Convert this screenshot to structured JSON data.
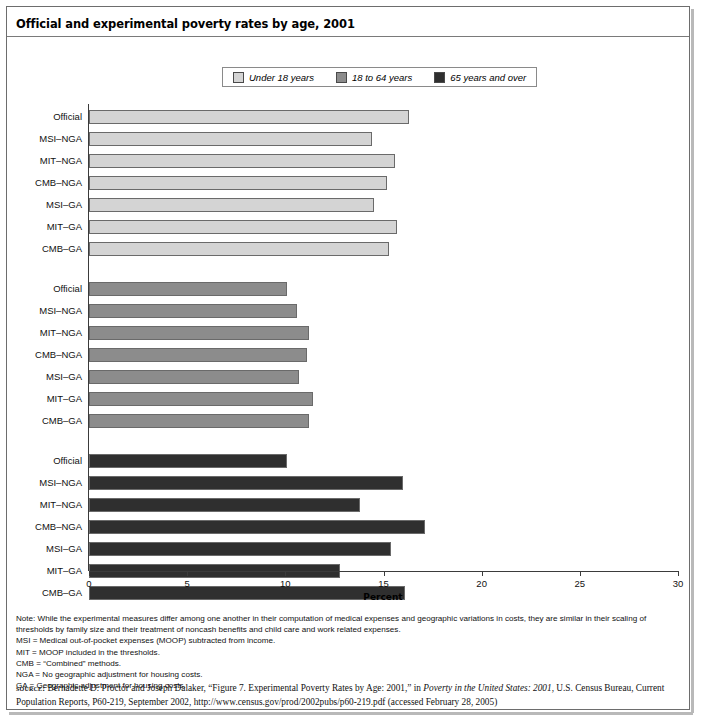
{
  "title": "Official and experimental poverty rates by age, 2001",
  "legend": {
    "position": "top-center",
    "items": [
      {
        "label": "Under 18 years",
        "color": "#d4d4d4"
      },
      {
        "label": "18 to 64 years",
        "color": "#8c8c8c"
      },
      {
        "label": "65 years and over",
        "color": "#2f2f2f"
      }
    ]
  },
  "axis": {
    "xlabel": "Percent",
    "ticks": [
      "0",
      "5",
      "10",
      "15",
      "20",
      "25",
      "30"
    ]
  },
  "notes": {
    "line1": "Note: While the experimental measures differ among one another in their computation of medical expenses and geographic variations in costs, they are similar in their scaling of",
    "line2": "thresholds by family size and their treatment of noncash benefits and child care and work related expenses.",
    "line3": "MSI = Medical out-of-pocket expenses (MOOP) subtracted from income.",
    "line4": "MIT = MOOP included in the thresholds.",
    "line5": "CMB = “Combined” methods.",
    "line6": "NGA = No geographic adjustment for housing costs.",
    "line7": "GA = Geographic adjustment for housing costs."
  },
  "source": {
    "label": "source:",
    "part1": " Bernadette D. Proctor and Joseph Dalaker, “Figure 7. Experimental Poverty Rates by Age: 2001,” in ",
    "italic1": "Poverty in the United States: 2001",
    "part2": ", U.S. Census Bureau, Current Population Reports, P60-219, September 2002, http://www.census.gov/prod/2002pubs/p60-219.pdf (accessed February 28, 2005)"
  },
  "chart_data": {
    "type": "bar",
    "orientation": "horizontal",
    "title": "Official and experimental poverty rates by age, 2001",
    "xlabel": "Percent",
    "ylabel": "",
    "xlim": [
      0,
      30
    ],
    "xticks": [
      0,
      5,
      10,
      15,
      20,
      25,
      30
    ],
    "grid": false,
    "legend_position": "top-center",
    "categories": [
      "Official",
      "MSI–NGA",
      "MIT–NGA",
      "CMB–NGA",
      "MSI–GA",
      "MIT–GA",
      "CMB–GA"
    ],
    "series": [
      {
        "name": "Under 18 years",
        "color": "#d4d4d4",
        "values": [
          16.3,
          14.4,
          15.6,
          15.2,
          14.5,
          15.7,
          15.3
        ]
      },
      {
        "name": "18 to 64 years",
        "color": "#8c8c8c",
        "values": [
          10.1,
          10.6,
          11.2,
          11.1,
          10.7,
          11.4,
          11.2
        ]
      },
      {
        "name": "65 years and over",
        "color": "#2f2f2f",
        "values": [
          10.1,
          16.0,
          13.8,
          17.1,
          15.4,
          12.8,
          16.1
        ]
      }
    ]
  }
}
